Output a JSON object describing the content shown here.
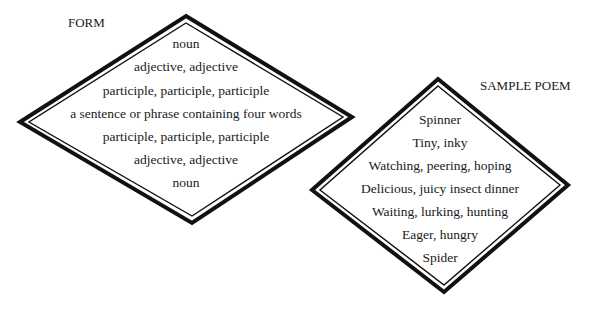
{
  "form": {
    "label": "FORM",
    "lines": [
      "noun",
      "adjective, adjective",
      "participle, participle, participle",
      "a sentence or phrase containing four words",
      "participle, participle, participle",
      "adjective, adjective",
      "noun"
    ]
  },
  "sample": {
    "label": "SAMPLE POEM",
    "lines": [
      "Spinner",
      "Tiny, inky",
      "Watching, peering, hoping",
      "Delicious, juicy insect dinner",
      "Waiting, lurking, hunting",
      "Eager, hungry",
      "Spider"
    ]
  },
  "colors": {
    "stroke": "#111111",
    "text": "#1a1a1a",
    "background": "#ffffff"
  }
}
